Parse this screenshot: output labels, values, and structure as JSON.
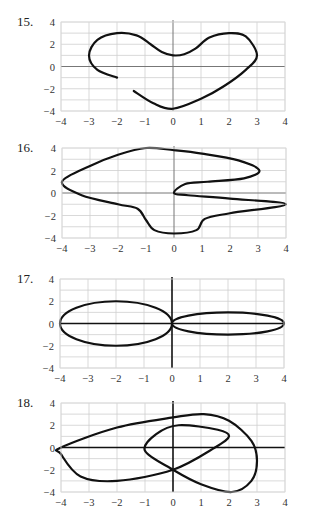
{
  "chart_data": [
    {
      "id": "15",
      "label": "15.",
      "type": "line",
      "title": "",
      "xlabel": "",
      "ylabel": "",
      "xlim": [
        -4,
        4
      ],
      "ylim": [
        -4,
        4
      ],
      "x_ticks": [
        -4,
        -3,
        -2,
        -1,
        0,
        1,
        2,
        3,
        4
      ],
      "y_ticks": [
        -4,
        -2,
        0,
        2,
        4
      ],
      "grid": true,
      "axis_style": "thin",
      "closed": false,
      "box": {
        "left": 61,
        "top": 22,
        "right": 285,
        "bottom": 111
      },
      "points": [
        [
          -2,
          -1
        ],
        [
          -2.7,
          -0.3
        ],
        [
          -3,
          1
        ],
        [
          -2.7,
          2.4
        ],
        [
          -2,
          3
        ],
        [
          -1.3,
          2.8
        ],
        [
          -0.8,
          2
        ],
        [
          -0.4,
          1.3
        ],
        [
          0,
          1
        ],
        [
          0.4,
          1.1
        ],
        [
          0.8,
          1.6
        ],
        [
          1.3,
          2.6
        ],
        [
          2,
          3
        ],
        [
          2.6,
          2.7
        ],
        [
          3,
          1
        ],
        [
          2.6,
          -0.3
        ],
        [
          1.8,
          -1.8
        ],
        [
          1,
          -2.9
        ],
        [
          0,
          -3.8
        ],
        [
          -0.7,
          -3.3
        ],
        [
          -1.4,
          -2.2
        ]
      ]
    },
    {
      "id": "16",
      "label": "16.",
      "type": "line",
      "title": "",
      "xlabel": "",
      "ylabel": "",
      "xlim": [
        -4,
        4
      ],
      "ylim": [
        -4,
        4
      ],
      "x_ticks": [
        -4,
        -3,
        -2,
        -1,
        0,
        1,
        2,
        3,
        4
      ],
      "y_ticks": [
        -4,
        -2,
        0,
        2,
        4
      ],
      "grid": true,
      "axis_style": "thin",
      "closed": true,
      "box": {
        "left": 62,
        "top": 148,
        "right": 286,
        "bottom": 238
      },
      "points": [
        [
          0,
          0
        ],
        [
          0.4,
          0.8
        ],
        [
          1.2,
          1
        ],
        [
          2.5,
          1.3
        ],
        [
          3.05,
          2
        ],
        [
          2.3,
          2.9
        ],
        [
          1,
          3.5
        ],
        [
          0,
          3.8
        ],
        [
          -1,
          4
        ],
        [
          -2,
          3.4
        ],
        [
          -3,
          2.4
        ],
        [
          -4,
          1
        ],
        [
          -3.3,
          -0.2
        ],
        [
          -2,
          -1
        ],
        [
          -1.3,
          -1.4
        ],
        [
          -1,
          -2.4
        ],
        [
          -0.7,
          -3.3
        ],
        [
          0,
          -3.6
        ],
        [
          0.8,
          -3.3
        ],
        [
          1.1,
          -2.3
        ],
        [
          2,
          -1.8
        ],
        [
          4,
          -1
        ],
        [
          2,
          -0.5
        ],
        [
          0.5,
          -0.2
        ]
      ]
    },
    {
      "id": "17",
      "label": "17.",
      "type": "line",
      "title": "",
      "xlabel": "",
      "ylabel": "",
      "xlim": [
        -4,
        4
      ],
      "ylim": [
        -4,
        4
      ],
      "x_ticks": [
        -4,
        -3,
        -2,
        -1,
        0,
        1,
        2,
        3,
        4
      ],
      "y_ticks": [
        -4,
        -2,
        0,
        2,
        4
      ],
      "grid": true,
      "axis_style": "thick",
      "closed": true,
      "box": {
        "left": 60,
        "top": 279,
        "right": 284,
        "bottom": 368
      },
      "ellipses": [
        {
          "cx": -2,
          "cy": 0,
          "rx": 2,
          "ry": 2
        },
        {
          "cx": 2,
          "cy": 0,
          "rx": 2,
          "ry": 1
        }
      ]
    },
    {
      "id": "18",
      "label": "18.",
      "type": "line",
      "title": "",
      "xlabel": "",
      "ylabel": "",
      "xlim": [
        -4,
        4
      ],
      "ylim": [
        -4,
        4
      ],
      "x_ticks": [
        -4,
        -3,
        -2,
        -1,
        0,
        1,
        2,
        3,
        4
      ],
      "y_ticks": [
        -4,
        -2,
        0,
        2,
        4
      ],
      "grid": true,
      "axis_style": "thick",
      "closed": true,
      "box": {
        "left": 61,
        "top": 403,
        "right": 285,
        "bottom": 492
      },
      "points": [
        [
          -4,
          0
        ],
        [
          -2,
          1.8
        ],
        [
          0,
          2.7
        ],
        [
          1.1,
          3
        ],
        [
          2,
          2.4
        ],
        [
          2.8,
          0.6
        ],
        [
          3,
          -1.2
        ],
        [
          2.8,
          -3
        ],
        [
          2.1,
          -4
        ],
        [
          1,
          -3.3
        ],
        [
          0,
          -2
        ],
        [
          -1,
          -0.3
        ],
        [
          -0.6,
          1.2
        ],
        [
          0.2,
          2
        ],
        [
          1.6,
          1.6
        ],
        [
          2,
          1
        ],
        [
          1.5,
          0
        ],
        [
          0,
          -2
        ],
        [
          -2,
          -3
        ],
        [
          -3.3,
          -2.6
        ],
        [
          -4,
          -0.6
        ]
      ]
    }
  ]
}
